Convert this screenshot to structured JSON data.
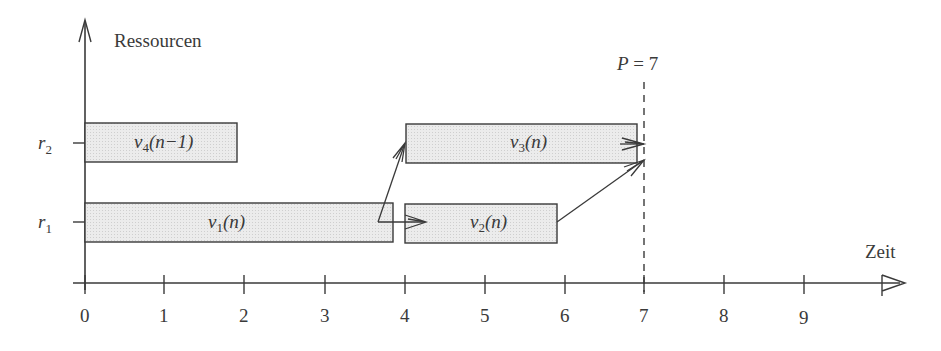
{
  "colors": {
    "ink": "#3a3a3a",
    "bar_fill": "#e6e6e6",
    "bar_stroke": "#3a3a3a",
    "background": "#ffffff"
  },
  "axes": {
    "y_label": "Ressourcen",
    "x_label": "Zeit",
    "x_ticks": [
      "0",
      "1",
      "2",
      "3",
      "4",
      "5",
      "6",
      "7",
      "8",
      "9"
    ],
    "y_ticks": [
      {
        "base": "r",
        "sub": "2"
      },
      {
        "base": "r",
        "sub": "1"
      }
    ]
  },
  "period_marker": {
    "label": "P = 7",
    "label_var": "P",
    "label_rest": " = 7",
    "x": 7
  },
  "tasks": [
    {
      "id": "v4",
      "base": "v",
      "sub": "4",
      "arg": "(n−1)",
      "resource": "r2",
      "start": 0,
      "end": 1.9
    },
    {
      "id": "v1",
      "base": "v",
      "sub": "1",
      "arg": "(n)",
      "resource": "r1",
      "start": 0,
      "end": 3.85
    },
    {
      "id": "v2",
      "base": "v",
      "sub": "2",
      "arg": "(n)",
      "resource": "r1",
      "start": 4,
      "end": 5.9
    },
    {
      "id": "v3",
      "base": "v",
      "sub": "3",
      "arg": "(n)",
      "resource": "r2",
      "start": 4,
      "end": 6.9
    }
  ],
  "dependencies": [
    {
      "from": "v1",
      "to": "v3"
    },
    {
      "from": "v1",
      "to": "v2"
    },
    {
      "from": "v2",
      "to": "end"
    },
    {
      "from": "v3",
      "to": "end"
    }
  ]
}
